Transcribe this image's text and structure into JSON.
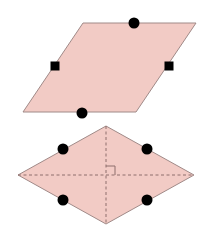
{
  "colors": {
    "fill": "#f2cbc5",
    "stroke": "#a08a88",
    "marker": "#000000",
    "diagonal": "#8e6e6c",
    "background": "#ffffff"
  },
  "shapes": [
    {
      "name": "parallelogram",
      "vertices": [
        [
          83,
          23
        ],
        [
          196,
          23
        ],
        [
          136,
          112
        ],
        [
          23,
          112
        ]
      ],
      "markers": [
        {
          "type": "circle",
          "x": 134,
          "y": 23,
          "r": 5.5
        },
        {
          "type": "circle",
          "x": 82,
          "y": 113,
          "r": 5.5
        },
        {
          "type": "square",
          "x": 55,
          "y": 66,
          "size": 9
        },
        {
          "type": "square",
          "x": 169,
          "y": 66,
          "size": 9
        }
      ]
    },
    {
      "name": "rhombus",
      "vertices": [
        [
          106,
          126
        ],
        [
          194,
          175
        ],
        [
          106,
          224
        ],
        [
          18,
          175
        ]
      ],
      "diagonals": [
        [
          [
            106,
            126
          ],
          [
            106,
            224
          ]
        ],
        [
          [
            18,
            175
          ],
          [
            194,
            175
          ]
        ]
      ],
      "right_angle_mark": {
        "x": 106,
        "y": 175,
        "size": 9
      },
      "markers": [
        {
          "type": "circle",
          "x": 63,
          "y": 149,
          "r": 5.5
        },
        {
          "type": "circle",
          "x": 147,
          "y": 149,
          "r": 5.5
        },
        {
          "type": "circle",
          "x": 63,
          "y": 200,
          "r": 5.5
        },
        {
          "type": "circle",
          "x": 147,
          "y": 200,
          "r": 5.5
        }
      ]
    }
  ]
}
